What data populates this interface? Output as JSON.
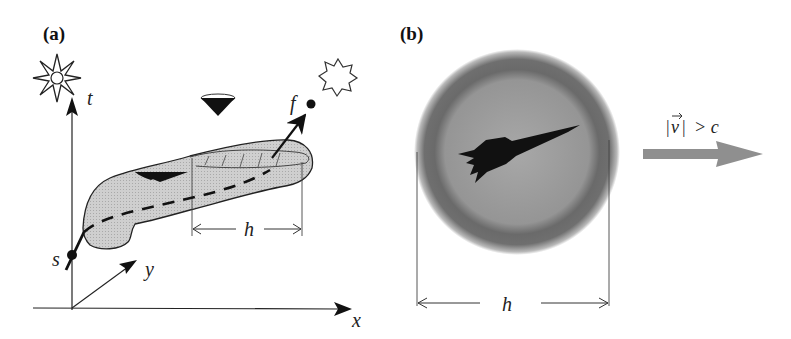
{
  "figure": {
    "panel_a": {
      "label": "(a)",
      "axes": {
        "t": "t",
        "x": "x",
        "y": "y"
      },
      "points": {
        "start": "s",
        "finish": "f"
      },
      "dimension": "h",
      "icons": [
        "explosion-star",
        "emission-star",
        "light-cone-upper",
        "light-cone-lower"
      ]
    },
    "panel_b": {
      "label": "(b)",
      "dimension": "h",
      "velocity_label": "|v⃗| > c",
      "velocity_parts": {
        "lbar": "|",
        "v": "v",
        "rbar": "|",
        "relation": "> c"
      },
      "icons": [
        "warp-bubble",
        "rocket",
        "velocity-arrow"
      ]
    },
    "colors": {
      "ink": "#111111",
      "tube_fill": "#c9c9c9",
      "bubble_outer": "#6e6e6e",
      "bubble_inner": "#9c9c9c",
      "arrow_gray": "#8f8f8f"
    }
  }
}
